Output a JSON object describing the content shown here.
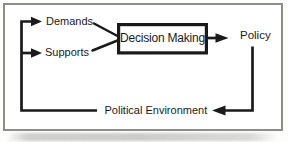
{
  "diagram": {
    "nodes": {
      "demands": "Demands",
      "supports": "Supports",
      "decision_making": "Decision Making",
      "policy": "Policy",
      "political_environment": "Political Environment"
    },
    "edges": [
      "Political Environment -> Demands",
      "Political Environment -> Supports",
      "Demands -> Decision Making",
      "Supports -> Decision Making",
      "Decision Making -> Policy",
      "Policy -> Political Environment"
    ],
    "colors": {
      "line": "#1a1a1a",
      "text": "#1a1a1a",
      "frame_border": "#8d8d8a",
      "background": "#ffffff"
    }
  }
}
